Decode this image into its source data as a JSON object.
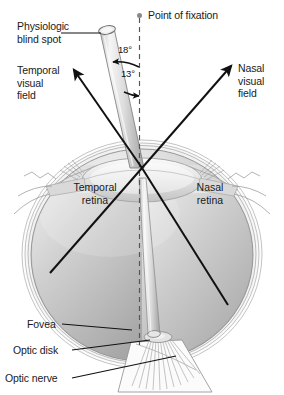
{
  "figure": {
    "width": 284,
    "height": 395,
    "background": "#ffffff"
  },
  "labels": {
    "physiologic_blind_spot": "Physiologic\nblind spot",
    "temporal_visual_field": "Temporal\nvisual\nfield",
    "nasal_visual_field": "Nasal\nvisual\nfield",
    "point_of_fixation": "Point of fixation",
    "temporal_retina": "Temporal\nretina",
    "nasal_retina": "Nasal\nretina",
    "fovea": "Fovea",
    "optic_disk": "Optic disk",
    "optic_nerve": "Optic nerve"
  },
  "angles": {
    "blind_spot_outer": "18°",
    "blind_spot_inner": "13°"
  },
  "colors": {
    "line": "#111111",
    "sclera_outline": "#9a9a9a",
    "retina_fill_light": "#e8e8e8",
    "retina_fill_mid": "#b9b9b9",
    "retina_fill_dark": "#9d9d9d",
    "lens_light": "#f2f2f2",
    "cylinder_light": "#f0f0f0",
    "cylinder_dark": "#a8a8a8",
    "fixation_dot": "#8a8a8a",
    "dashed_axis": "#555555",
    "text": "#1a1a1a"
  },
  "icons": {
    "fixation_dot": "filled-circle-icon",
    "arrow_temporal": "arrow-up-left-icon",
    "arrow_nasal": "arrow-up-right-icon",
    "arrow_angle_18": "arc-arrow-icon",
    "arrow_angle_13": "arc-arrow-icon"
  },
  "geometry": {
    "nodal_point": [
      142,
      168
    ],
    "eye_center": [
      142,
      255
    ],
    "eye_radius_x": 113,
    "eye_radius_y": 107,
    "optic_axis_x": 142,
    "blind_spot_axis_deg": 18,
    "visual_axis_deg": 13
  }
}
